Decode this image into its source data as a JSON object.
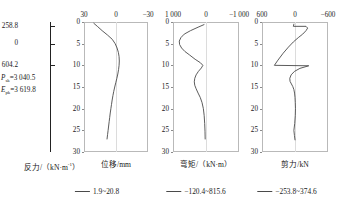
{
  "pile": {
    "labels": [
      {
        "text": "258.8",
        "depth": 1.0
      },
      {
        "text": "0",
        "depth": 5.0
      },
      {
        "text": "604.2",
        "depth": 10.0
      }
    ],
    "properties": [
      {
        "symbol": "P",
        "subscript": "sk",
        "value": "=3 040.5"
      },
      {
        "symbol": "E",
        "subscript": "pk",
        "value": "=3 619.8"
      }
    ]
  },
  "panels": [
    {
      "id": "reaction-displacement",
      "xlabel": "位移/mm",
      "left_axis_label": "反力/（kN·m",
      "left_axis_sup": "-1",
      "left_axis_tail": "）",
      "xticks": [
        "30",
        "0",
        "−30"
      ],
      "xlim": [
        30,
        -30
      ],
      "legend": "1.9~20.8"
    },
    {
      "id": "bending-moment",
      "xlabel": "弯矩/（kN·m）",
      "xticks": [
        "1 000",
        "0",
        "−1 000"
      ],
      "xlim": [
        1000,
        -1000
      ],
      "legend": "−120.4~815.6"
    },
    {
      "id": "shear-force",
      "xlabel": "剪力/kN",
      "xticks": [
        "600",
        "0",
        "−600"
      ],
      "xlim": [
        600,
        -600
      ],
      "legend": "−253.8~374.6"
    }
  ],
  "yaxis": {
    "ticks": [
      "0",
      "5",
      "10",
      "15",
      "20",
      "25",
      "30"
    ],
    "values": [
      0,
      5,
      10,
      15,
      20,
      25,
      30
    ],
    "ylim": [
      0,
      30
    ]
  },
  "chart_data": {
    "type": "line",
    "title": "",
    "ylabel": "深度/m",
    "ylim": [
      0,
      30
    ],
    "grid": "center-vertical",
    "legend_position": "below",
    "line_color": "#4a4a4a",
    "subplots": [
      {
        "name": "位移/mm",
        "xlabel": "位移/mm",
        "xlim": [
          30,
          -30
        ],
        "xticks": [
          30,
          0,
          -30
        ],
        "range_label": "1.9~20.8",
        "series": [
          {
            "name": "displacement",
            "x": [
              20.8,
              17.5,
              13.0,
              8.0,
              3.5,
              0.8,
              -1.0,
              -2.2,
              -2.9,
              -3.1,
              -2.9,
              -2.4,
              -1.7,
              -0.8,
              0.2,
              1.2,
              2.1,
              2.9,
              3.6,
              4.2,
              4.8,
              5.4,
              5.9,
              6.4,
              6.9,
              7.4,
              7.9,
              8.4
            ],
            "y": [
              0.3,
              1.0,
              2.0,
              3.0,
              4.0,
              5.0,
              6.0,
              7.0,
              8.0,
              9.0,
              10.0,
              11.0,
              12.0,
              13.0,
              14.0,
              15.0,
              16.0,
              17.0,
              18.0,
              19.0,
              20.0,
              21.0,
              22.0,
              23.0,
              24.0,
              25.0,
              26.0,
              27.0
            ]
          }
        ]
      },
      {
        "name": "弯矩/（kN·m）",
        "xlabel": "弯矩/（kN·m）",
        "xlim": [
          1000,
          -1000
        ],
        "xticks": [
          1000,
          0,
          -1000
        ],
        "range_label": "−120.4~815.6",
        "series": [
          {
            "name": "bending-moment",
            "x": [
              60,
              240,
              470,
              660,
              760,
              810,
              800,
              740,
              640,
              500,
              330,
              170,
              95,
              140,
              230,
              300,
              340,
              355,
              340,
              300,
              240,
              175,
              120,
              80,
              55,
              40,
              30,
              25
            ],
            "y": [
              0.6,
              1.2,
              2.0,
              2.8,
              3.6,
              4.4,
              5.2,
              6.0,
              6.8,
              7.6,
              8.6,
              9.4,
              10.0,
              10.6,
              11.4,
              12.2,
              13.0,
              13.8,
              14.6,
              15.4,
              16.4,
              17.4,
              18.6,
              20.0,
              21.6,
              23.4,
              25.2,
              27.0
            ]
          }
        ]
      },
      {
        "name": "剪力/kN",
        "xlabel": "剪力/kN",
        "xlim": [
          600,
          -600
        ],
        "xticks": [
          600,
          0,
          -600
        ],
        "range_label": "−253.8~374.6",
        "series": [
          {
            "name": "shear-force",
            "x": [
              20,
              30,
              -200,
              -230,
              -200,
              -140,
              -60,
              30,
              120,
              215,
              310,
              375,
              -250,
              -90,
              10,
              70,
              95,
              90,
              65,
              40,
              20,
              8,
              0,
              -5,
              -8,
              -5,
              5,
              20,
              10,
              0
            ],
            "y": [
              0.5,
              1.0,
              1.0,
              1.4,
              2.0,
              2.8,
              3.6,
              4.6,
              5.8,
              7.2,
              8.8,
              10.0,
              10.1,
              10.7,
              11.4,
              12.2,
              13.0,
              13.7,
              14.3,
              14.9,
              15.6,
              16.4,
              17.4,
              18.6,
              20.0,
              21.6,
              23.4,
              25.0,
              26.2,
              27.2
            ]
          }
        ]
      }
    ]
  }
}
